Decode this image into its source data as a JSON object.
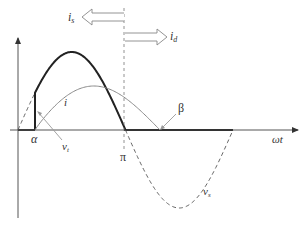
{
  "diagram": {
    "type": "waveform",
    "colors": {
      "axis": "#555555",
      "source_voltage_dashed": "#555555",
      "thyristor_voltage_thick": "#222222",
      "current_thin": "#8a8a8a",
      "pointer": "#9a9a9a",
      "arrow_outline": "#888888"
    },
    "axes": {
      "x_label": "ωt",
      "y_label": ""
    },
    "labels": {
      "alpha": "α",
      "pi": "π",
      "beta": "β",
      "vt_main": "v",
      "vt_sub": "t",
      "vs_main": "v",
      "vs_sub": "s",
      "i": "i",
      "is_main": "i",
      "is_sub": "s",
      "id_main": "i",
      "id_sub": "d"
    },
    "curves": [
      {
        "name": "v_s",
        "style": "dashed",
        "shape": "full sine period 0 to 2π"
      },
      {
        "name": "v_t",
        "style": "thick solid",
        "shape": "sine segment from α to π, vertical step at α"
      },
      {
        "name": "i",
        "style": "thin solid",
        "shape": "current pulse from α to β"
      }
    ],
    "arrows": [
      {
        "name": "i_s",
        "direction": "left"
      },
      {
        "name": "i_d",
        "direction": "right"
      }
    ]
  }
}
